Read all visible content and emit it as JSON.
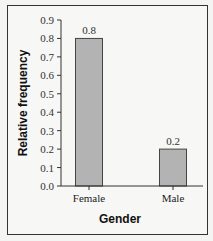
{
  "chart_data": {
    "type": "bar",
    "title": "",
    "xlabel": "Gender",
    "ylabel": "Relative frequency",
    "categories": [
      "Female",
      "Male"
    ],
    "values": [
      0.8,
      0.2
    ],
    "data_labels": [
      "0.8",
      "0.2"
    ],
    "ylim": [
      0.0,
      0.9
    ],
    "yticks": [
      "0.0",
      "0.1",
      "0.2",
      "0.3",
      "0.4",
      "0.5",
      "0.6",
      "0.7",
      "0.8",
      "0.9"
    ],
    "grid": false,
    "legend": null,
    "bar_color": "#b3b3b3",
    "bar_edge_color": "#444444"
  }
}
